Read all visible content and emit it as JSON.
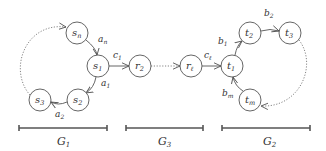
{
  "diagram": {
    "nodes": [
      {
        "id": "sn",
        "base": "s",
        "sub": "n",
        "x": 77,
        "y": 33
      },
      {
        "id": "s1",
        "base": "s",
        "sub": "1",
        "x": 98,
        "y": 66
      },
      {
        "id": "s2",
        "base": "s",
        "sub": "2",
        "x": 78,
        "y": 100
      },
      {
        "id": "s3",
        "base": "s",
        "sub": "3",
        "x": 40,
        "y": 100
      },
      {
        "id": "r2",
        "base": "r",
        "sub": "2",
        "x": 140,
        "y": 66
      },
      {
        "id": "rl",
        "base": "r",
        "sub": "ℓ",
        "x": 191,
        "y": 66
      },
      {
        "id": "t1",
        "base": "t",
        "sub": "1",
        "x": 232,
        "y": 66
      },
      {
        "id": "t2",
        "base": "t",
        "sub": "2",
        "x": 250,
        "y": 33
      },
      {
        "id": "t3",
        "base": "t",
        "sub": "3",
        "x": 290,
        "y": 33
      },
      {
        "id": "tm",
        "base": "t",
        "sub": "m",
        "x": 250,
        "y": 100
      }
    ],
    "edge_labels": {
      "an": {
        "base": "a",
        "sub": "n"
      },
      "a1": {
        "base": "a",
        "sub": "1"
      },
      "a2": {
        "base": "a",
        "sub": "2"
      },
      "c1": {
        "base": "c",
        "sub": "1"
      },
      "cl": {
        "base": "c",
        "sub": "ℓ"
      },
      "b1": {
        "base": "b",
        "sub": "1"
      },
      "b2": {
        "base": "b",
        "sub": "2"
      },
      "bm": {
        "base": "b",
        "sub": "m"
      }
    },
    "groups": [
      {
        "base": "G",
        "sub": "1"
      },
      {
        "base": "G",
        "sub": "3"
      },
      {
        "base": "G",
        "sub": "2"
      }
    ]
  }
}
